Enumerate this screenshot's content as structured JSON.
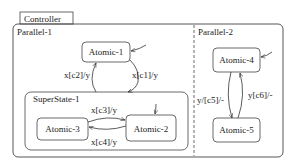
{
  "diagram": {
    "title": "Controller",
    "regions": [
      {
        "id": "parallel-1",
        "label": "Parallel-1"
      },
      {
        "id": "parallel-2",
        "label": "Parallel-2"
      }
    ],
    "superstate": {
      "label": "SuperState-1"
    },
    "states": {
      "atomic1": "Atomic-1",
      "atomic2": "Atomic-2",
      "atomic3": "Atomic-3",
      "atomic4": "Atomic-4",
      "atomic5": "Atomic-5"
    },
    "transitions": {
      "t_c1": "x[c1]/y",
      "t_c2": "x[c2]/y",
      "t_c3": "x[c3]/y",
      "t_c4": "x[c4]/y",
      "t_c5": "y/[c5]/-",
      "t_c6": "y[c6]/-"
    },
    "colors": {
      "stroke": "#333333",
      "background": "#ffffff",
      "text": "#222222"
    }
  }
}
